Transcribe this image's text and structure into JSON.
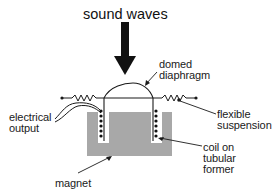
{
  "diagram": {
    "title": "sound waves",
    "labels": {
      "domed_diaphragm": [
        "domed",
        "diaphragm"
      ],
      "electrical_output": [
        "electrical",
        "output"
      ],
      "flexible_suspension": [
        "flexible",
        "suspension"
      ],
      "coil_on_tubular_former": [
        "coil on",
        "tubular",
        "former"
      ],
      "magnet": "magnet"
    },
    "colors": {
      "line": "#1a1a1a",
      "magnet_fill": "#a8a8a8",
      "background": "#ffffff"
    },
    "components": [
      "sound-wave-arrow",
      "domed-diaphragm",
      "flexible-suspension",
      "tubular-former",
      "coil",
      "magnet",
      "electrical-output-leads"
    ]
  }
}
